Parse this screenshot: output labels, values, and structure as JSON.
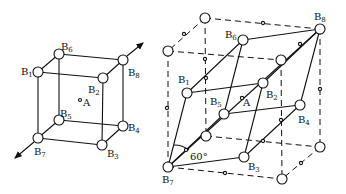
{
  "figure": {
    "left_cube": {
      "labels": {
        "B1": "B",
        "B2": "B",
        "B3": "B",
        "B4": "B",
        "B5": "B",
        "B6": "B",
        "B7": "B",
        "B8": "B"
      },
      "subs": {
        "B1": "1",
        "B2": "2",
        "B3": "3",
        "B4": "4",
        "B5": "5",
        "B6": "6",
        "B7": "7",
        "B8": "8"
      },
      "center": "A"
    },
    "right_cube": {
      "labels": {
        "B1": "B",
        "B2": "B",
        "B3": "B",
        "B4": "B",
        "B5": "B",
        "B6": "B",
        "B7": "B",
        "B8": "B"
      },
      "subs": {
        "B1": "1",
        "B2": "2",
        "B3": "3",
        "B4": "4",
        "B5": "5",
        "B6": "6",
        "B7": "7",
        "B8": "8"
      },
      "center": "A",
      "angle": "60°"
    },
    "stroke_color": "#111111"
  }
}
